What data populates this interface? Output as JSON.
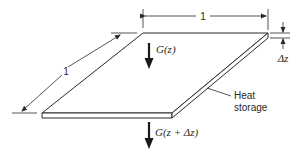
{
  "diagram": {
    "type": "heat-flux-slab",
    "colors": {
      "line": "#2a2a2a",
      "background": "#ffffff"
    },
    "labels": {
      "width_dim": "1",
      "depth_dim": "1",
      "thickness_dim": "Δz",
      "flux_in": "G(z)",
      "flux_out": "G(z + Δz)",
      "heat_storage_line1": "Heat",
      "heat_storage_line2": "storage"
    }
  }
}
